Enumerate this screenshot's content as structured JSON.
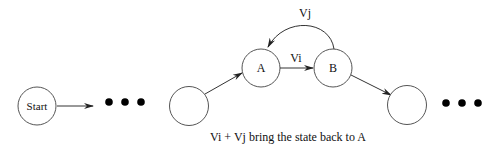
{
  "diagram": {
    "nodes": {
      "start": {
        "label": "Start"
      },
      "unnamed_left": {
        "label": ""
      },
      "a": {
        "label": "A"
      },
      "b": {
        "label": "B"
      },
      "unnamed_right": {
        "label": ""
      }
    },
    "edges": {
      "a_to_b": {
        "label": "Vi"
      },
      "b_to_a": {
        "label": "Vj"
      }
    },
    "ellipsis_left": "continuation-dots",
    "ellipsis_right": "continuation-dots",
    "caption": "Vi + Vj bring the state back to A"
  },
  "colors": {
    "stroke": "#555555",
    "text": "#111111",
    "dots": "#000000",
    "background": "#ffffff"
  }
}
